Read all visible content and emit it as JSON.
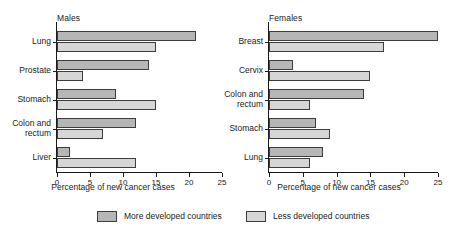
{
  "chart_data": [
    {
      "type": "bar",
      "title": "Males",
      "orientation": "horizontal",
      "categories": [
        "Lung",
        "Prostate",
        "Stomach",
        "Colon and rectum",
        "Liver"
      ],
      "series": [
        {
          "name": "More developed countries",
          "values": [
            21,
            14,
            9,
            12,
            2
          ]
        },
        {
          "name": "Less developed countries",
          "values": [
            15,
            4,
            15,
            7,
            12
          ]
        }
      ],
      "xlabel": "Percentage of new cancer cases",
      "ylabel": "",
      "xlim": [
        0,
        25
      ],
      "xticks": [
        0,
        5,
        10,
        15,
        20,
        25
      ],
      "grid": false
    },
    {
      "type": "bar",
      "title": "Females",
      "orientation": "horizontal",
      "categories": [
        "Breast",
        "Cervix",
        "Colon and rectum",
        "Stomach",
        "Lung"
      ],
      "series": [
        {
          "name": "More developed countries",
          "values": [
            25,
            3.5,
            14,
            7,
            8
          ]
        },
        {
          "name": "Less developed countries",
          "values": [
            17,
            15,
            6,
            9,
            6
          ]
        }
      ],
      "xlabel": "Percentage of new cancer cases",
      "ylabel": "",
      "xlim": [
        0,
        25
      ],
      "xticks": [
        0,
        5,
        10,
        15,
        20,
        25
      ],
      "grid": false
    }
  ],
  "legend": {
    "position": "bottom",
    "items": [
      {
        "label": "More developed countries",
        "color": "#b6b6b6"
      },
      {
        "label": "Less developed countries",
        "color": "#d6d6d6"
      }
    ]
  }
}
